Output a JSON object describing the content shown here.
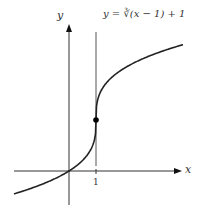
{
  "diagram": {
    "equation": "y = ∛(x − 1) + 1",
    "x_axis_label": "x",
    "y_axis_label": "y",
    "tick_label": "1",
    "highlighted_point": "(1, 1)",
    "vertical_tangent": "x = 1"
  }
}
